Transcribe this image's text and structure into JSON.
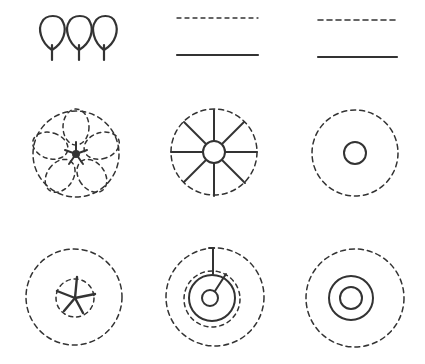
{
  "diagram": {
    "type": "symbol-legend-grid",
    "layout": {
      "rows": 3,
      "columns": 3
    },
    "colors": {
      "ink": "#333333",
      "background": "#ffffff"
    },
    "symbols": [
      {
        "row": 1,
        "col": 1,
        "name": "three-leaf-trees",
        "description": "Three loop-shaped tree symbols with stems"
      },
      {
        "row": 1,
        "col": 2,
        "name": "dashed-over-solid-line",
        "description": "Short-dash line above a solid line"
      },
      {
        "row": 1,
        "col": 3,
        "name": "dashed-over-solid-line-alt",
        "description": "Longer-dash line above a solid line"
      },
      {
        "row": 2,
        "col": 1,
        "name": "dashed-petal-flower",
        "description": "Dashed circle with five dashed petal loops around a star center"
      },
      {
        "row": 2,
        "col": 2,
        "name": "spoked-wheel",
        "description": "Dashed circle with eight radial spokes and small center circle"
      },
      {
        "row": 2,
        "col": 3,
        "name": "dashed-ring-small-circle",
        "description": "Dashed circle with small solid circle at center"
      },
      {
        "row": 3,
        "col": 1,
        "name": "dashed-ring-star",
        "description": "Dashed outer circle, dashed inner circle with five-point star"
      },
      {
        "row": 3,
        "col": 2,
        "name": "ring-with-stem",
        "description": "Dashed outer circle, dashed and solid inner rings, small circle with stem line"
      },
      {
        "row": 3,
        "col": 3,
        "name": "dashed-ring-double-circle",
        "description": "Dashed outer circle with two concentric solid circles"
      }
    ]
  }
}
